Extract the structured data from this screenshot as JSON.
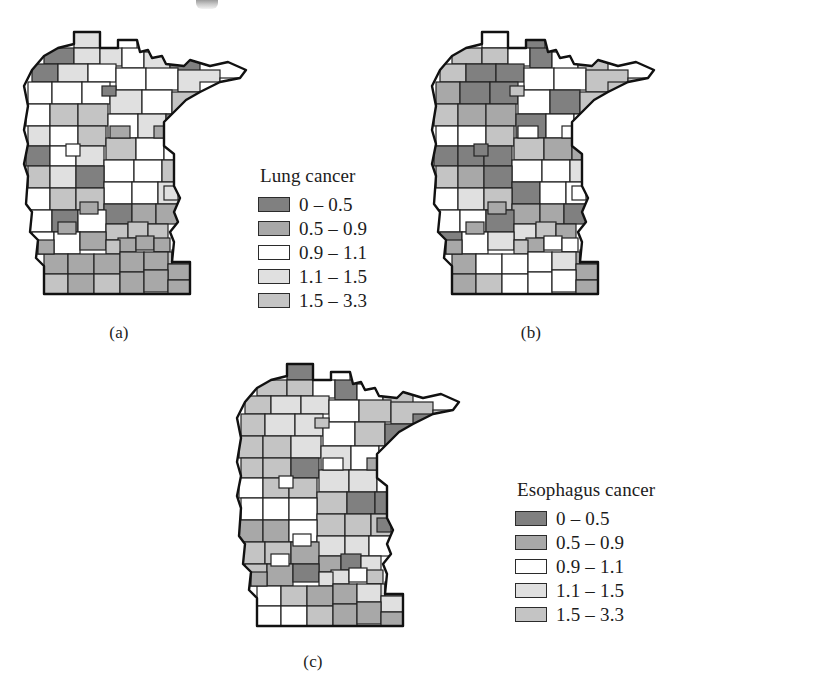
{
  "figure": {
    "kind": "three-panel choropleth map figure",
    "region": "Minnesota counties"
  },
  "chart_data": {
    "type": "heatmap",
    "title": "",
    "subtitle": "",
    "xlabel": "",
    "ylabel": "",
    "grid": false,
    "legend_position": "right of each map",
    "map_region": "Minnesota, USA (county level)",
    "value_meaning": "standardized mortality/incidence ratio (SMR)",
    "shared_bins": [
      "0 – 0.5",
      "0.5 – 0.9",
      "0.9 – 1.1",
      "1.1 – 1.5",
      "1.5 – 3.3"
    ],
    "bin_colors": [
      "#808080",
      "#a8a8a8",
      "#ffffff",
      "#e0e0e0",
      "#c4c4c4"
    ],
    "panels": [
      {
        "id": "a",
        "caption": "(a)",
        "legend_title": "Lung cancer",
        "bin_counts": [
          12,
          23,
          21,
          16,
          15
        ]
      },
      {
        "id": "b",
        "caption": "(b)",
        "legend_title": "Larynx cancer",
        "bin_counts": [
          19,
          26,
          14,
          15,
          13
        ]
      },
      {
        "id": "c",
        "caption": "(c)",
        "legend_title": "Esophagus cancer",
        "bin_counts": [
          16,
          21,
          19,
          17,
          14
        ]
      }
    ]
  },
  "panels": {
    "a": {
      "caption": "(a)",
      "legend": {
        "title": "Lung cancer",
        "rows": [
          {
            "label": "0 – 0.5",
            "color": "#808080",
            "swatch_name": "swatch-bin-1"
          },
          {
            "label": "0.5 – 0.9",
            "color": "#a8a8a8",
            "swatch_name": "swatch-bin-2"
          },
          {
            "label": "0.9 – 1.1",
            "color": "#ffffff",
            "swatch_name": "swatch-bin-3"
          },
          {
            "label": "1.1 – 1.5",
            "color": "#e0e0e0",
            "swatch_name": "swatch-bin-4"
          },
          {
            "label": "1.5 – 3.3",
            "color": "#c4c4c4",
            "swatch_name": "swatch-bin-5"
          }
        ]
      }
    },
    "b": {
      "caption": "(b)",
      "legend": {
        "title": "Larynx cancer",
        "rows": [
          {
            "label": "0 – 0.5",
            "color": "#808080",
            "swatch_name": "swatch-bin-1"
          },
          {
            "label": "0.5 – 0.9",
            "color": "#a8a8a8",
            "swatch_name": "swatch-bin-2"
          },
          {
            "label": "0.9 – 1.1",
            "color": "#ffffff",
            "swatch_name": "swatch-bin-3"
          },
          {
            "label": "1.1 – 1.5",
            "color": "#e0e0e0",
            "swatch_name": "swatch-bin-4"
          },
          {
            "label": "1.5 – 3.3",
            "color": "#c4c4c4",
            "swatch_name": "swatch-bin-5"
          }
        ]
      }
    },
    "c": {
      "caption": "(c)",
      "legend": {
        "title": "Esophagus cancer",
        "rows": [
          {
            "label": "0 – 0.5",
            "color": "#808080",
            "swatch_name": "swatch-bin-1"
          },
          {
            "label": "0.5 – 0.9",
            "color": "#a8a8a8",
            "swatch_name": "swatch-bin-2"
          },
          {
            "label": "0.9 – 1.1",
            "color": "#ffffff",
            "swatch_name": "swatch-bin-3"
          },
          {
            "label": "1.1 – 1.5",
            "color": "#e0e0e0",
            "swatch_name": "swatch-bin-4"
          },
          {
            "label": "1.5 – 3.3",
            "color": "#c4c4c4",
            "swatch_name": "swatch-bin-5"
          }
        ]
      }
    }
  },
  "county_fills": {
    "a": [
      3,
      3,
      2,
      0,
      3,
      3,
      2,
      3,
      0,
      0,
      3,
      2,
      2,
      2,
      3,
      2,
      2,
      2,
      2,
      2,
      3,
      2,
      4,
      2,
      4,
      4,
      2,
      3,
      0,
      3,
      2,
      4,
      4,
      2,
      2,
      0,
      2,
      3,
      2,
      2,
      4,
      4,
      3,
      0,
      2,
      2,
      3,
      2,
      4,
      4,
      0,
      1,
      1,
      2,
      0,
      2,
      4,
      4,
      4,
      1,
      1,
      1,
      2,
      2,
      1,
      4,
      4,
      4,
      1,
      1,
      1,
      1,
      1,
      1,
      4,
      1,
      4,
      1,
      1,
      1,
      1,
      1,
      1,
      1,
      1,
      1,
      1
    ],
    "b": [
      2,
      0,
      0,
      4,
      4,
      2,
      0,
      2,
      4,
      4,
      0,
      0,
      2,
      2,
      4,
      4,
      4,
      1,
      0,
      0,
      2,
      0,
      4,
      4,
      1,
      1,
      0,
      2,
      2,
      2,
      2,
      4,
      4,
      1,
      1,
      0,
      0,
      0,
      2,
      2,
      3,
      4,
      1,
      0,
      0,
      2,
      2,
      2,
      3,
      4,
      1,
      1,
      0,
      2,
      2,
      0,
      3,
      4,
      1,
      1,
      2,
      2,
      0,
      2,
      3,
      4,
      1,
      1,
      1,
      2,
      2,
      2,
      3,
      1,
      1,
      4,
      2,
      2,
      2,
      1,
      1,
      1,
      1,
      2,
      2,
      1,
      1
    ],
    "c": [
      0,
      0,
      2,
      4,
      4,
      2,
      0,
      2,
      4,
      4,
      3,
      3,
      2,
      4,
      4,
      0,
      4,
      4,
      3,
      3,
      2,
      4,
      0,
      4,
      4,
      3,
      3,
      2,
      2,
      4,
      4,
      0,
      3,
      3,
      2,
      2,
      4,
      4,
      4,
      0,
      0,
      2,
      2,
      2,
      4,
      4,
      4,
      1,
      1,
      2,
      3,
      3,
      2,
      4,
      4,
      1,
      1,
      0,
      3,
      3,
      2,
      4,
      4,
      1,
      0,
      3,
      3,
      2,
      2,
      4,
      1,
      1,
      3,
      3,
      2,
      2,
      4,
      1,
      1,
      1,
      1,
      2,
      2,
      2,
      1,
      1,
      1
    ]
  }
}
